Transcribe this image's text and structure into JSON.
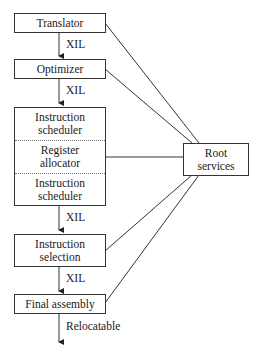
{
  "diagram": {
    "stages": [
      {
        "id": "translator",
        "label": "Translator"
      },
      {
        "id": "optimizer",
        "label": "Optimizer"
      },
      {
        "id": "backend",
        "segments": [
          {
            "label_line1": "Instruction",
            "label_line2": "scheduler"
          },
          {
            "label_line1": "Register",
            "label_line2": "allocator"
          },
          {
            "label_line1": "Instruction",
            "label_line2": "scheduler"
          }
        ]
      },
      {
        "id": "instruction-selection",
        "label_line1": "Instruction",
        "label_line2": "selection"
      },
      {
        "id": "final-assembly",
        "label": "Final assembly"
      }
    ],
    "edges": [
      {
        "from": "translator",
        "to": "optimizer",
        "label": "XIL"
      },
      {
        "from": "optimizer",
        "to": "backend",
        "label": "XIL"
      },
      {
        "from": "backend",
        "to": "instruction-selection",
        "label": "XIL"
      },
      {
        "from": "instruction-selection",
        "to": "final-assembly",
        "label": "XIL"
      },
      {
        "from": "final-assembly",
        "to": "output",
        "label": "Relocatable"
      }
    ],
    "root": {
      "label_line1": "Root",
      "label_line2": "services"
    }
  }
}
